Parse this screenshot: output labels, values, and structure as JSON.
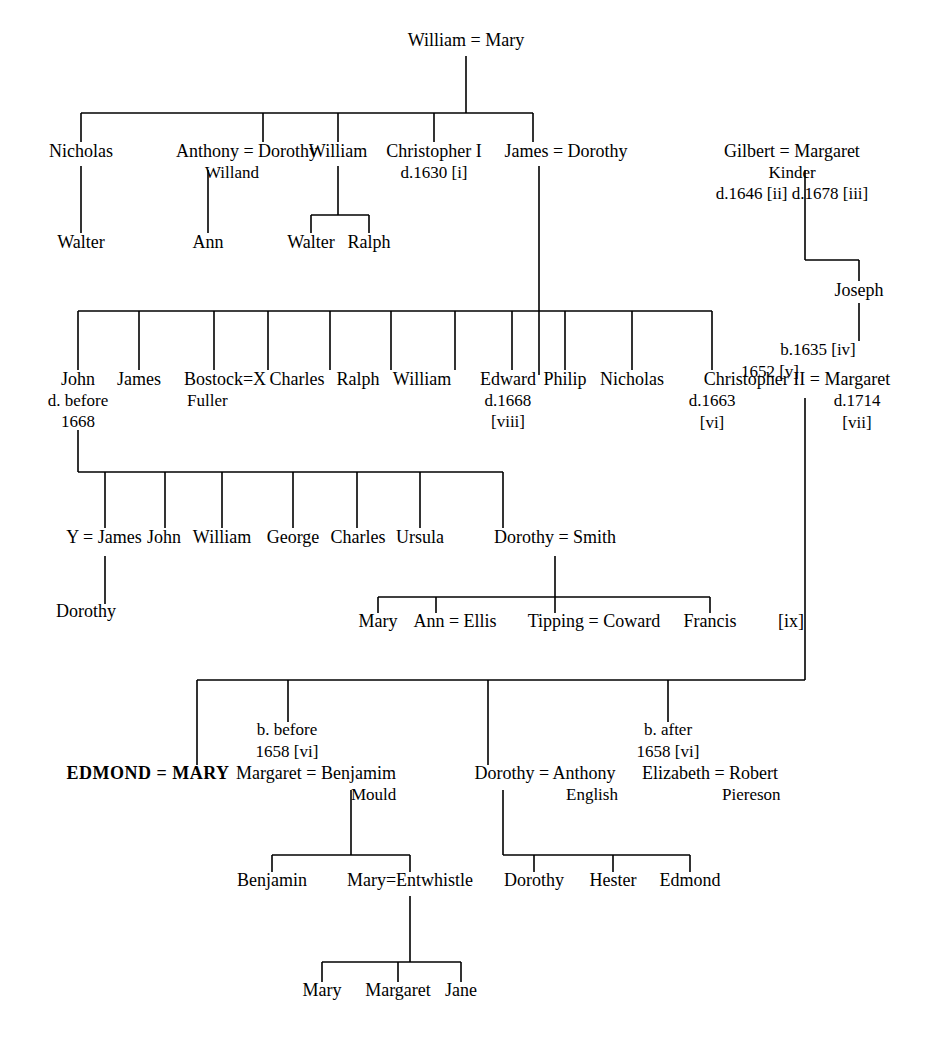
{
  "diagram": {
    "line_color": "#000000",
    "background": "#ffffff"
  },
  "nodes": [
    {
      "id": "g0",
      "text": "William = Mary",
      "x": 466,
      "y": 46
    },
    {
      "id": "g1a",
      "text": "Nicholas",
      "x": 81,
      "y": 157
    },
    {
      "id": "g1b",
      "text": "Anthony = Dorothy",
      "x": 247,
      "y": 157,
      "sub": "Willand",
      "sub_align": "left",
      "sub_x": 205
    },
    {
      "id": "g1c",
      "text": "William",
      "x": 338,
      "y": 157
    },
    {
      "id": "g1d",
      "text": "Christopher I",
      "x": 434,
      "y": 157,
      "sub": "d.1630 [i]"
    },
    {
      "id": "g1e",
      "text": "James = Dorothy",
      "x": 566,
      "y": 157
    },
    {
      "id": "g1f",
      "text": "Gilbert = Margaret",
      "x": 792,
      "y": 157,
      "sub": "Kinder",
      "sub2": "d.1646 [ii]  d.1678 [iii]"
    },
    {
      "id": "g2a",
      "text": "Walter",
      "x": 81,
      "y": 248
    },
    {
      "id": "g2b",
      "text": "Ann",
      "x": 208,
      "y": 248
    },
    {
      "id": "g2c",
      "text": "Walter",
      "x": 311,
      "y": 248
    },
    {
      "id": "g2d",
      "text": "Ralph",
      "x": 369,
      "y": 248
    },
    {
      "id": "g2e",
      "text": "Joseph",
      "x": 859,
      "y": 296
    },
    {
      "id": "g3a",
      "text": "John",
      "x": 78,
      "y": 385,
      "sub": "d. before",
      "sub2": "1668"
    },
    {
      "id": "g3b",
      "text": "James",
      "x": 139,
      "y": 385
    },
    {
      "id": "g3c",
      "text": "Bostock=X",
      "x": 225,
      "y": 385,
      "sub": "Fuller",
      "sub_align": "left",
      "sub_x": 187
    },
    {
      "id": "g3d",
      "text": "Charles",
      "x": 297,
      "y": 385
    },
    {
      "id": "g3e",
      "text": "Ralph",
      "x": 358,
      "y": 385
    },
    {
      "id": "g3f",
      "text": "William",
      "x": 422,
      "y": 385
    },
    {
      "id": "g3g",
      "text": "Edward",
      "x": 508,
      "y": 385,
      "sub": "d.1668",
      "sub2": "[viii]"
    },
    {
      "id": "g3h",
      "text": "Philip",
      "x": 565,
      "y": 385
    },
    {
      "id": "g3i",
      "text": "Nicholas",
      "x": 632,
      "y": 385
    },
    {
      "id": "g3j",
      "text": "Christopher II = Margaret",
      "x": 797,
      "y": 385,
      "sub_left": "d.1663",
      "sub_left_x": 712,
      "sub_right": "d.1714",
      "sub_right_x": 857,
      "sub2_left": "[vi]",
      "sub2_right": "[vii]"
    },
    {
      "id": "g4a",
      "text": "Y = James",
      "x": 104,
      "y": 543
    },
    {
      "id": "g4b",
      "text": "John",
      "x": 164,
      "y": 543
    },
    {
      "id": "g4c",
      "text": "William",
      "x": 222,
      "y": 543
    },
    {
      "id": "g4d",
      "text": "George",
      "x": 293,
      "y": 543
    },
    {
      "id": "g4e",
      "text": "Charles",
      "x": 358,
      "y": 543
    },
    {
      "id": "g4f",
      "text": "Ursula",
      "x": 420,
      "y": 543
    },
    {
      "id": "g4g",
      "text": "Dorothy = Smith",
      "x": 555,
      "y": 543
    },
    {
      "id": "g5a",
      "text": "Dorothy",
      "x": 86,
      "y": 617
    },
    {
      "id": "g5b",
      "text": "Mary",
      "x": 378,
      "y": 627
    },
    {
      "id": "g5c",
      "text": "Ann = Ellis",
      "x": 455,
      "y": 627
    },
    {
      "id": "g5d",
      "text": "Tipping = Coward",
      "x": 594,
      "y": 627
    },
    {
      "id": "g5e",
      "text": "Francis",
      "x": 710,
      "y": 627
    },
    {
      "id": "g5f",
      "text": "[ix]",
      "x": 791,
      "y": 627
    },
    {
      "id": "g6a",
      "text": "EDMOND = MARY",
      "x": 148,
      "y": 779,
      "bold": true
    },
    {
      "id": "g6b",
      "text": "Margaret = Benjamim",
      "x": 316,
      "y": 779,
      "sub": "Mould",
      "sub_align": "left",
      "sub_x": 351
    },
    {
      "id": "g6c",
      "text": "Dorothy = Anthony",
      "x": 545,
      "y": 779,
      "sub": "English",
      "sub_align": "left",
      "sub_x": 566
    },
    {
      "id": "g6d",
      "text": "Elizabeth = Robert",
      "x": 710,
      "y": 779,
      "sub": "Piereson",
      "sub_align": "left",
      "sub_x": 722
    },
    {
      "id": "g7a",
      "text": "Benjamin",
      "x": 272,
      "y": 886
    },
    {
      "id": "g7b",
      "text": "Mary=Entwhistle",
      "x": 410,
      "y": 886
    },
    {
      "id": "g7c",
      "text": "Dorothy",
      "x": 534,
      "y": 886
    },
    {
      "id": "g7d",
      "text": "Hester",
      "x": 613,
      "y": 886
    },
    {
      "id": "g7e",
      "text": "Edmond",
      "x": 690,
      "y": 886
    },
    {
      "id": "g8a",
      "text": "Mary",
      "x": 322,
      "y": 996
    },
    {
      "id": "g8b",
      "text": "Margaret",
      "x": 398,
      "y": 996
    },
    {
      "id": "g8c",
      "text": "Jane",
      "x": 461,
      "y": 996
    }
  ],
  "annotations": [
    {
      "id": "a1",
      "text": "b.1635 [iv]",
      "x": 818,
      "y": 355
    },
    {
      "id": "a2",
      "text": "1652 [v]",
      "x": 770,
      "y": 377
    },
    {
      "id": "a3",
      "text": "b. before",
      "x": 287,
      "y": 735
    },
    {
      "id": "a4",
      "text": "1658 [vi]",
      "x": 287,
      "y": 757
    },
    {
      "id": "a5",
      "text": "b. after",
      "x": 668,
      "y": 735
    },
    {
      "id": "a6",
      "text": "1658 [vi]",
      "x": 668,
      "y": 757
    }
  ],
  "edges": {
    "description": "connector polylines, x/y in px",
    "segments": [
      {
        "name": "root-drop",
        "points": "466,56 466,113"
      },
      {
        "name": "gen1-bus",
        "points": "81,113 533,113"
      },
      {
        "name": "gen1-drop-a",
        "points": "81,113 81,142"
      },
      {
        "name": "gen1-drop-b",
        "points": "263,113 263,142"
      },
      {
        "name": "gen1-drop-c",
        "points": "338,113 338,142"
      },
      {
        "name": "gen1-drop-d",
        "points": "434,113 434,142"
      },
      {
        "name": "gen1-drop-e",
        "points": "533,113 533,142"
      },
      {
        "name": "nicholas-walter",
        "points": "81,166 81,233"
      },
      {
        "name": "anthony-ann",
        "points": "208,170 208,233"
      },
      {
        "name": "william-bus",
        "points": "338,166 338,215"
      },
      {
        "name": "william-bus2",
        "points": "311,215 369,215"
      },
      {
        "name": "william-d1",
        "points": "311,215 311,233"
      },
      {
        "name": "william-d2",
        "points": "369,215 369,233"
      },
      {
        "name": "james-long-drop",
        "points": "539,166 539,375"
      },
      {
        "name": "gilbert-drop",
        "points": "805,170 805,260"
      },
      {
        "name": "gilbert-bus",
        "points": "805,260 859,260"
      },
      {
        "name": "joseph-drop",
        "points": "859,260 859,281"
      },
      {
        "name": "joseph-down",
        "points": "859,303 859,341"
      },
      {
        "name": "gen3-bus",
        "points": "78,311 712,311"
      },
      {
        "name": "gen3-d1",
        "points": "78,311 78,370"
      },
      {
        "name": "gen3-d2",
        "points": "139,311 139,370"
      },
      {
        "name": "gen3-d3",
        "points": "214,311 214,370"
      },
      {
        "name": "gen3-d4",
        "points": "268,311 268,370"
      },
      {
        "name": "gen3-d5",
        "points": "330,311 330,370"
      },
      {
        "name": "gen3-d6",
        "points": "391,311 391,370"
      },
      {
        "name": "gen3-d7",
        "points": "455,311 455,370"
      },
      {
        "name": "gen3-d8",
        "points": "512,311 512,370"
      },
      {
        "name": "gen3-d9",
        "points": "565,311 565,370"
      },
      {
        "name": "gen3-d10",
        "points": "632,311 632,370"
      },
      {
        "name": "gen3-d11",
        "points": "712,311 712,370"
      },
      {
        "name": "john-drop",
        "points": "78,430 78,472"
      },
      {
        "name": "gen4-bus",
        "points": "78,472 503,472"
      },
      {
        "name": "gen4-d1",
        "points": "105,472 105,528"
      },
      {
        "name": "gen4-d2",
        "points": "165,472 165,528"
      },
      {
        "name": "gen4-d3",
        "points": "222,472 222,528"
      },
      {
        "name": "gen4-d4",
        "points": "293,472 293,528"
      },
      {
        "name": "gen4-d5",
        "points": "357,472 357,528"
      },
      {
        "name": "gen4-d6",
        "points": "420,472 420,528"
      },
      {
        "name": "gen4-d7",
        "points": "503,472 503,528"
      },
      {
        "name": "y-james-drop",
        "points": "105,556 105,604"
      },
      {
        "name": "smith-drop",
        "points": "555,556 555,597"
      },
      {
        "name": "smith-bus",
        "points": "378,597 710,597"
      },
      {
        "name": "smith-d1",
        "points": "378,597 378,613"
      },
      {
        "name": "smith-d2",
        "points": "436,597 436,613"
      },
      {
        "name": "smith-d3",
        "points": "555,597 555,613"
      },
      {
        "name": "smith-d4",
        "points": "710,597 710,613"
      },
      {
        "name": "chris2-long",
        "points": "805,398 805,680"
      },
      {
        "name": "gen6-bus",
        "points": "197,680 805,680"
      },
      {
        "name": "gen6-d1",
        "points": "197,680 197,765"
      },
      {
        "name": "gen6-d2",
        "points": "288,680 288,722"
      },
      {
        "name": "gen6-d3",
        "points": "488,680 488,765"
      },
      {
        "name": "gen6-d4",
        "points": "668,680 668,722"
      },
      {
        "name": "mould-drop",
        "points": "351,790 351,855"
      },
      {
        "name": "mould-bus",
        "points": "272,855 410,855"
      },
      {
        "name": "mould-d1",
        "points": "272,855 272,872"
      },
      {
        "name": "mould-d2",
        "points": "410,855 410,872"
      },
      {
        "name": "english-drop",
        "points": "503,790 503,855"
      },
      {
        "name": "english-bus",
        "points": "503,855 690,855"
      },
      {
        "name": "english-d1",
        "points": "534,855 534,872"
      },
      {
        "name": "english-d2",
        "points": "613,855 613,872"
      },
      {
        "name": "english-d3",
        "points": "690,855 690,872"
      },
      {
        "name": "entwhistle-drop",
        "points": "410,896 410,962"
      },
      {
        "name": "entwhistle-bus",
        "points": "322,962 461,962"
      },
      {
        "name": "ent-d1",
        "points": "322,962 322,982"
      },
      {
        "name": "ent-d2",
        "points": "398,962 398,982"
      },
      {
        "name": "ent-d3",
        "points": "461,962 461,982"
      }
    ]
  }
}
